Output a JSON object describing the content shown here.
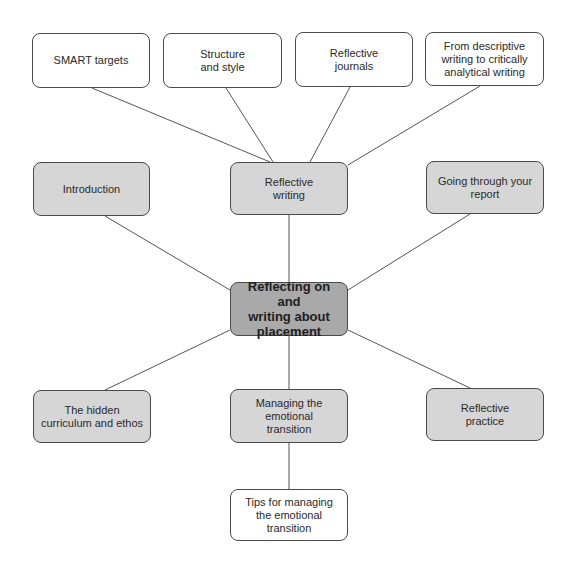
{
  "diagram": {
    "type": "mind-map",
    "colors": {
      "line": "#555555",
      "center_fill": "#a9a9a9",
      "primary_fill": "#d6d6d6",
      "secondary_fill": "#ffffff",
      "border": "#4a4a4a"
    },
    "center": {
      "id": "center",
      "label": "Reflecting on and\nwriting about\nplacement"
    },
    "primary_nodes": [
      {
        "id": "introduction",
        "label": "Introduction"
      },
      {
        "id": "reflective-writing",
        "label": "Reflective\nwriting"
      },
      {
        "id": "going-through-report",
        "label": "Going through your\nreport"
      },
      {
        "id": "hidden-curriculum",
        "label": "The hidden\ncurriculum and ethos"
      },
      {
        "id": "managing-emotional-transition",
        "label": "Managing the\nemotional\ntransition"
      },
      {
        "id": "reflective-practice",
        "label": "Reflective\npractice"
      }
    ],
    "secondary_nodes": [
      {
        "id": "smart-targets",
        "parent": "reflective-writing",
        "label": "SMART targets"
      },
      {
        "id": "structure-style",
        "parent": "reflective-writing",
        "label": "Structure\nand style"
      },
      {
        "id": "reflective-journals",
        "parent": "reflective-writing",
        "label": "Reflective\njournals"
      },
      {
        "id": "descriptive-to-analytical",
        "parent": "reflective-writing",
        "label": "From descriptive\nwriting to critically\nanalytical writing"
      },
      {
        "id": "tips-emotional-transition",
        "parent": "managing-emotional-transition",
        "label": "Tips for managing\nthe emotional\ntransition"
      }
    ]
  }
}
